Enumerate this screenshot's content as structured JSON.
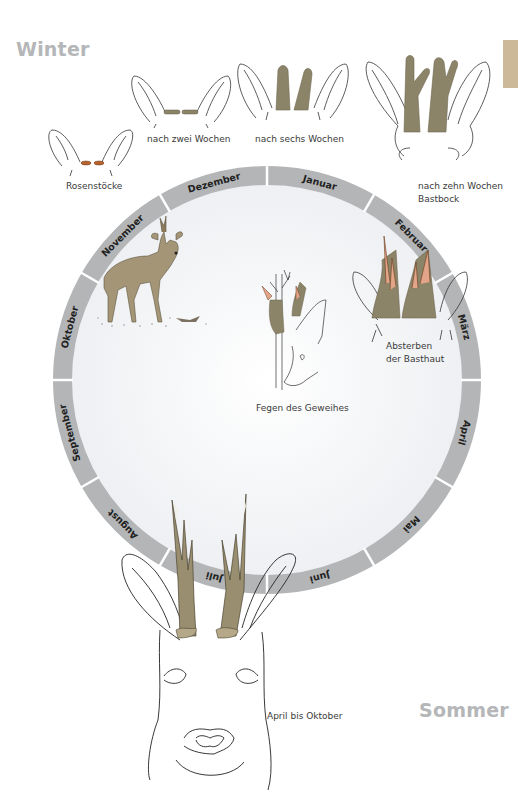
{
  "seasons": {
    "winter": "Winter",
    "summer": "Sommer"
  },
  "stages": [
    {
      "id": "rosenstoecke",
      "label": "Rosenstöcke"
    },
    {
      "id": "zwei-wochen",
      "label": "nach zwei Wochen"
    },
    {
      "id": "sechs-wochen",
      "label": "nach sechs Wochen"
    },
    {
      "id": "zehn-wochen",
      "label": "nach zehn Wochen",
      "label2": "Bastbock"
    },
    {
      "id": "basthaut",
      "label": "Absterben",
      "label2": "der Basthaut"
    },
    {
      "id": "fegen",
      "label": "Fegen des Geweihes"
    },
    {
      "id": "april-oktober",
      "label": "April bis Oktober"
    }
  ],
  "ring": {
    "center": [
      267,
      380
    ],
    "outer_radius": 214,
    "inner_radius": 195,
    "color": "#b3b5b7",
    "inner_fill": "#f4f5f7",
    "months": [
      "Januar",
      "Februar",
      "März",
      "April",
      "Mai",
      "Juni",
      "Juli",
      "August",
      "September",
      "Oktober",
      "November",
      "Dezember"
    ]
  },
  "colors": {
    "antler_velvet": "#8c8468",
    "antler_bare": "#c9b48e",
    "rosette": "#b8632e",
    "deer_body": "#a49577",
    "tab_marker": "#cbb99a",
    "season_text": "#b4b6b8"
  }
}
